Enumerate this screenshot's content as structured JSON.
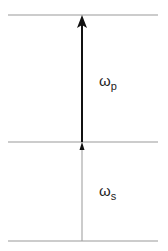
{
  "diagram": {
    "levels": [
      {
        "name": "upper-level",
        "y": 15
      },
      {
        "name": "middle-level",
        "y": 142
      },
      {
        "name": "ground-level",
        "y": 241
      }
    ],
    "transitions": [
      {
        "name": "pump",
        "symbol": "ω",
        "subscript": "p",
        "from_y": 142,
        "to_y": 15,
        "color": "#111111"
      },
      {
        "name": "signal",
        "symbol": "ω",
        "subscript": "s",
        "from_y": 241,
        "to_y": 142,
        "color": "#999999"
      }
    ]
  }
}
